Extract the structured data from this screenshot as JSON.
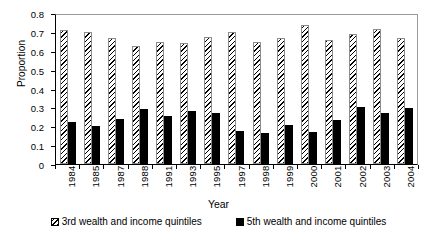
{
  "chart_data": {
    "type": "bar",
    "title": "",
    "xlabel": "Year",
    "ylabel": "Proportion",
    "ylim": [
      0,
      0.8
    ],
    "ytick_labels": [
      "0.8",
      "0.7",
      "0.6",
      "0.5",
      "0.4",
      "0.3",
      "0.2",
      "0.1",
      "0"
    ],
    "ytick_values": [
      0.8,
      0.7,
      0.6,
      0.5,
      0.4,
      0.3,
      0.2,
      0.1,
      0
    ],
    "grid": false,
    "legend_position": "bottom",
    "categories": [
      "1984",
      "1985",
      "1987",
      "1988",
      "1991",
      "1993",
      "1995",
      "1997",
      "1998",
      "1999",
      "2000",
      "2001",
      "2002",
      "2003",
      "2004"
    ],
    "series": [
      {
        "name": "3rd wealth and income quintiles",
        "style": "hatched",
        "values": [
          0.71,
          0.7,
          0.67,
          0.625,
          0.645,
          0.64,
          0.675,
          0.7,
          0.645,
          0.665,
          0.735,
          0.655,
          0.69,
          0.715,
          0.67
        ]
      },
      {
        "name": "5th wealth and income quintiles",
        "style": "solid-black",
        "values": [
          0.225,
          0.2,
          0.24,
          0.29,
          0.255,
          0.28,
          0.27,
          0.175,
          0.165,
          0.205,
          0.17,
          0.235,
          0.3,
          0.27,
          0.295
        ]
      }
    ]
  },
  "colors": {
    "series_hatched": "#000000",
    "series_solid": "#000000",
    "axis": "#000000",
    "frame": "#9a9a9a",
    "background": "#ffffff"
  }
}
